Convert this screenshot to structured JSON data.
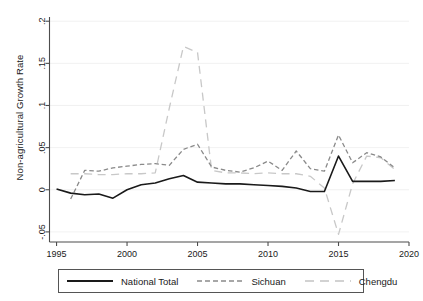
{
  "chart_data": {
    "type": "line",
    "title": "",
    "xlabel": "",
    "ylabel": "Non-agricultural Growth Rate",
    "xlim": [
      1994.5,
      2020.0
    ],
    "ylim": [
      -0.062,
      0.205
    ],
    "xticks": [
      1995,
      2000,
      2005,
      2010,
      2015,
      2020
    ],
    "xticklabels": [
      "1995",
      "2000",
      "2005",
      "2010",
      "2015",
      "2020"
    ],
    "yticks": [
      -0.05,
      0,
      0.05,
      0.1,
      0.15,
      0.2
    ],
    "yticklabels": [
      "-.05",
      "0",
      ".05",
      ".1",
      ".15",
      ".2"
    ],
    "grid": "horizontal-light",
    "legend_position": "below-plot",
    "series": [
      {
        "name": "National Total",
        "style": "solid",
        "color": "#1a1a1a",
        "width": 1.6,
        "x": [
          1995,
          1996,
          1997,
          1998,
          1999,
          2000,
          2001,
          2002,
          2003,
          2004,
          2005,
          2006,
          2007,
          2008,
          2009,
          2010,
          2011,
          2012,
          2013,
          2014,
          2015,
          2016,
          2017,
          2018,
          2019
        ],
        "values": [
          0.001,
          -0.004,
          -0.006,
          -0.005,
          -0.01,
          0.0,
          0.006,
          0.008,
          0.013,
          0.017,
          0.009,
          0.008,
          0.007,
          0.007,
          0.006,
          0.005,
          0.004,
          0.002,
          -0.002,
          -0.002,
          0.04,
          0.01,
          0.01,
          0.01,
          0.011
        ]
      },
      {
        "name": "Sichuan",
        "style": "dashed",
        "color": "#8a8a8a",
        "width": 1.3,
        "x": [
          1996,
          1997,
          1998,
          1999,
          2000,
          2001,
          2002,
          2003,
          2004,
          2005,
          2006,
          2007,
          2008,
          2009,
          2010,
          2011,
          2012,
          2013,
          2014,
          2015,
          2016,
          2017,
          2018,
          2019
        ],
        "values": [
          -0.011,
          0.023,
          0.022,
          0.026,
          0.028,
          0.03,
          0.031,
          0.029,
          0.048,
          0.054,
          0.027,
          0.023,
          0.021,
          0.026,
          0.034,
          0.023,
          0.046,
          0.025,
          0.022,
          0.065,
          0.032,
          0.044,
          0.039,
          0.026
        ]
      },
      {
        "name": "Chengdu",
        "style": "longdash",
        "color": "#c8c8c8",
        "width": 1.3,
        "x": [
          1996,
          1997,
          1998,
          1999,
          2000,
          2001,
          2002,
          2003,
          2004,
          2005,
          2006,
          2007,
          2008,
          2009,
          2010,
          2011,
          2012,
          2013,
          2014,
          2015,
          2016,
          2017,
          2018,
          2019
        ],
        "values": [
          0.019,
          0.019,
          0.018,
          0.018,
          0.019,
          0.019,
          0.02,
          0.097,
          0.17,
          0.163,
          0.023,
          0.02,
          0.02,
          0.019,
          0.02,
          0.019,
          0.019,
          0.016,
          0.002,
          -0.053,
          0.007,
          0.04,
          0.038,
          0.024
        ]
      }
    ]
  },
  "legend": {
    "items": [
      {
        "label": "National Total"
      },
      {
        "label": "Sichuan"
      },
      {
        "label": "Chengdu"
      }
    ]
  }
}
